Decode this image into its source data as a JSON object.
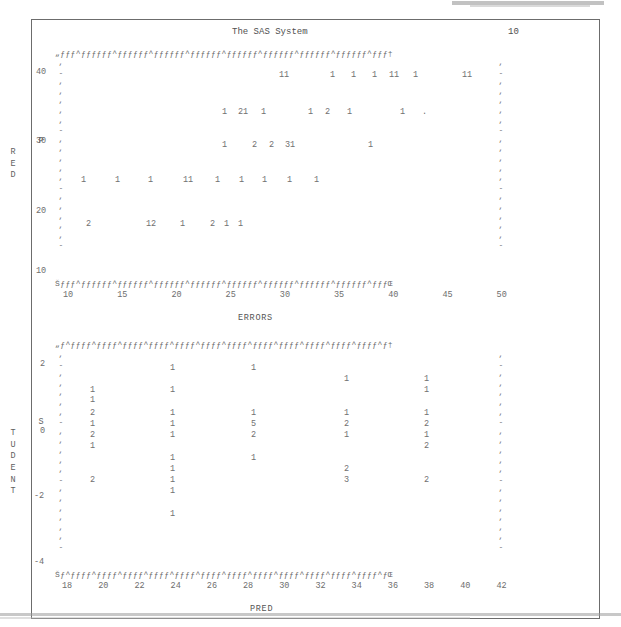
{
  "window": {
    "background_color": "#ffffff",
    "text_color": "#585858",
    "frame_color": "#6c6c6c"
  },
  "report": {
    "title": "The SAS System",
    "page_number": "10"
  },
  "plot1": {
    "y_axis_label": "PRED",
    "x_axis_label": "ERRORS",
    "y_ticks": [
      "40",
      "30",
      "20",
      "10"
    ],
    "x_ticks": [
      "10",
      "15",
      "20",
      "25",
      "30",
      "35",
      "40",
      "45",
      "50"
    ],
    "top_frame": "„ƒƒƒ^ƒƒƒƒƒƒ^ƒƒƒƒƒƒ^ƒƒƒƒƒƒ^ƒƒƒƒƒƒ^ƒƒƒƒƒƒ^ƒƒƒƒƒƒ^ƒƒƒƒƒƒ^ƒƒƒƒƒƒ^ƒƒƒ†",
    "bottom_frame": "Šƒƒƒ^ƒƒƒƒƒƒ^ƒƒƒƒƒƒ^ƒƒƒƒƒƒ^ƒƒƒƒƒƒ^ƒƒƒƒƒƒ^ƒƒƒƒƒƒ^ƒƒƒƒƒƒ^ƒƒƒƒƒƒ^ƒƒƒŒ",
    "left_axis_marks": [
      ",",
      "-",
      ",",
      ",",
      ",",
      ",",
      ",",
      "-",
      ",",
      ",",
      ",",
      ",",
      ",",
      "-",
      ",",
      ",",
      ",",
      ",",
      ",",
      "-"
    ],
    "right_axis_marks": [
      ",",
      "-",
      ",",
      ",",
      ",",
      ",",
      ",",
      "-",
      ",",
      ",",
      ",",
      ",",
      ",",
      "-",
      ",",
      ",",
      ",",
      ",",
      ",",
      "-"
    ],
    "data_rows": [
      {
        "y": 71,
        "cells": [
          {
            "x": 279,
            "v": "11"
          },
          {
            "x": 330,
            "v": "1"
          },
          {
            "x": 351,
            "v": "1"
          },
          {
            "x": 372,
            "v": "1"
          },
          {
            "x": 389,
            "v": "11"
          },
          {
            "x": 413,
            "v": "1"
          },
          {
            "x": 462,
            "v": "11"
          }
        ]
      },
      {
        "y": 108,
        "cells": [
          {
            "x": 222,
            "v": "1"
          },
          {
            "x": 238,
            "v": "21"
          },
          {
            "x": 261,
            "v": "1"
          },
          {
            "x": 308,
            "v": "1"
          },
          {
            "x": 325,
            "v": "2"
          },
          {
            "x": 347,
            "v": "1"
          },
          {
            "x": 400,
            "v": "1"
          },
          {
            "x": 422,
            "v": "."
          }
        ]
      },
      {
        "y": 141,
        "cells": [
          {
            "x": 222,
            "v": "1"
          },
          {
            "x": 252,
            "v": "2"
          },
          {
            "x": 269,
            "v": "2"
          },
          {
            "x": 285,
            "v": "31"
          },
          {
            "x": 368,
            "v": "1"
          }
        ]
      },
      {
        "y": 176,
        "cells": [
          {
            "x": 81,
            "v": "1"
          },
          {
            "x": 115,
            "v": "1"
          },
          {
            "x": 148,
            "v": "1"
          },
          {
            "x": 183,
            "v": "11"
          },
          {
            "x": 215,
            "v": "1"
          },
          {
            "x": 239,
            "v": "1"
          },
          {
            "x": 262,
            "v": "1"
          },
          {
            "x": 287,
            "v": "1"
          },
          {
            "x": 314,
            "v": "1"
          }
        ]
      },
      {
        "y": 220,
        "cells": [
          {
            "x": 86,
            "v": "2"
          },
          {
            "x": 146,
            "v": "12"
          },
          {
            "x": 180,
            "v": "1"
          },
          {
            "x": 210,
            "v": "2"
          },
          {
            "x": 224,
            "v": "1"
          },
          {
            "x": 238,
            "v": "1"
          }
        ]
      }
    ]
  },
  "plot2": {
    "y_axis_label": "STUDENT",
    "x_axis_label": "PRED",
    "y_ticks": [
      "2",
      "0",
      "-2",
      "-4"
    ],
    "x_ticks": [
      "18",
      "20",
      "22",
      "24",
      "26",
      "28",
      "30",
      "32",
      "34",
      "36",
      "38",
      "40",
      "42"
    ],
    "top_frame": "„ƒ^ƒƒƒƒ^ƒƒƒƒ^ƒƒƒƒ^ƒƒƒƒ^ƒƒƒƒ^ƒƒƒƒ^ƒƒƒƒ^ƒƒƒƒ^ƒƒƒƒ^ƒƒƒƒ^ƒƒƒƒ^ƒƒƒƒ^ƒ†",
    "bottom_frame": "Šƒ^ƒƒƒƒ^ƒƒƒƒ^ƒƒƒƒ^ƒƒƒƒ^ƒƒƒƒ^ƒƒƒƒ^ƒƒƒƒ^ƒƒƒƒ^ƒƒƒƒ^ƒƒƒƒ^ƒƒƒƒ^ƒƒƒƒ^ƒŒ",
    "left_axis_marks": [
      ",",
      "-",
      ",",
      ",",
      ",",
      ",",
      ",",
      "-",
      ",",
      ",",
      ",",
      ",",
      ",",
      "-",
      ",",
      ",",
      ",",
      ",",
      ",",
      ",",
      "-"
    ],
    "right_axis_marks": [
      ",",
      "-",
      ",",
      ",",
      ",",
      ",",
      ",",
      "-",
      ",",
      ",",
      ",",
      ",",
      ",",
      "-",
      ",",
      ",",
      ",",
      ",",
      ",",
      ",",
      "-"
    ],
    "data_rows": [
      {
        "y": 364,
        "cells": [
          {
            "x": 170,
            "v": "1"
          },
          {
            "x": 251,
            "v": "1"
          },
          {
            "x": 344,
            "v": ""
          },
          {
            "x": 424,
            "v": ""
          }
        ]
      },
      {
        "y": 375,
        "cells": [
          {
            "x": 344,
            "v": "1"
          },
          {
            "x": 424,
            "v": "1"
          }
        ]
      },
      {
        "y": 386,
        "cells": [
          {
            "x": 90,
            "v": "1"
          },
          {
            "x": 170,
            "v": "1"
          },
          {
            "x": 424,
            "v": "1"
          }
        ]
      },
      {
        "y": 396,
        "cells": [
          {
            "x": 90,
            "v": "1"
          }
        ]
      },
      {
        "y": 409,
        "cells": [
          {
            "x": 90,
            "v": "2"
          },
          {
            "x": 170,
            "v": "1"
          },
          {
            "x": 251,
            "v": "1"
          },
          {
            "x": 344,
            "v": "1"
          },
          {
            "x": 424,
            "v": "1"
          }
        ]
      },
      {
        "y": 420,
        "cells": [
          {
            "x": 90,
            "v": "1"
          },
          {
            "x": 170,
            "v": "1"
          },
          {
            "x": 251,
            "v": "5"
          },
          {
            "x": 344,
            "v": "2"
          },
          {
            "x": 424,
            "v": "2"
          }
        ]
      },
      {
        "y": 431,
        "cells": [
          {
            "x": 90,
            "v": "2"
          },
          {
            "x": 170,
            "v": "1"
          },
          {
            "x": 251,
            "v": "2"
          },
          {
            "x": 344,
            "v": "1"
          },
          {
            "x": 424,
            "v": "1"
          }
        ]
      },
      {
        "y": 442,
        "cells": [
          {
            "x": 90,
            "v": "1"
          },
          {
            "x": 424,
            "v": "2"
          }
        ]
      },
      {
        "y": 454,
        "cells": [
          {
            "x": 170,
            "v": "1"
          },
          {
            "x": 251,
            "v": "1"
          }
        ]
      },
      {
        "y": 465,
        "cells": [
          {
            "x": 170,
            "v": "1"
          },
          {
            "x": 344,
            "v": "2"
          }
        ]
      },
      {
        "y": 476,
        "cells": [
          {
            "x": 90,
            "v": "2"
          },
          {
            "x": 170,
            "v": "1"
          },
          {
            "x": 344,
            "v": "3"
          },
          {
            "x": 424,
            "v": "2"
          }
        ]
      },
      {
        "y": 487,
        "cells": [
          {
            "x": 170,
            "v": "1"
          }
        ]
      },
      {
        "y": 510,
        "cells": [
          {
            "x": 170,
            "v": "1"
          }
        ]
      }
    ]
  }
}
